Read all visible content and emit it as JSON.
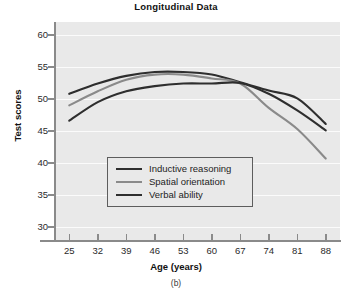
{
  "chart_data": {
    "type": "line",
    "title": "Longitudinal Data",
    "caption": "(b)",
    "xlabel": "Age (years)",
    "ylabel": "Test scores",
    "grid": true,
    "legend_position": "inside-lower-center",
    "x": [
      25,
      32,
      39,
      46,
      53,
      60,
      67,
      74,
      81,
      88
    ],
    "xtick_labels": [
      "25",
      "32",
      "39",
      "46",
      "53",
      "60",
      "67",
      "74",
      "81",
      "88"
    ],
    "ytick_labels": [
      "30",
      "35",
      "40",
      "45",
      "50",
      "55",
      "60"
    ],
    "yticks": [
      30,
      35,
      40,
      45,
      50,
      55,
      60
    ],
    "ylim": [
      28,
      62
    ],
    "xlim": [
      21.5,
      91.5
    ],
    "series": [
      {
        "name": "Inductive reasoning",
        "color": "#2e2e2e",
        "width": 2.1,
        "values": [
          50.8,
          52.4,
          53.6,
          54.2,
          54.2,
          53.8,
          52.6,
          51.3,
          50.1,
          46.1
        ]
      },
      {
        "name": "Spatial orientation",
        "color": "#8a8a8a",
        "width": 2.1,
        "values": [
          49.0,
          51.2,
          53.0,
          53.8,
          53.8,
          53.2,
          52.4,
          48.6,
          45.3,
          40.7
        ]
      },
      {
        "name": "Verbal ability",
        "color": "#2e2e2e",
        "width": 2.1,
        "values": [
          46.6,
          49.5,
          51.2,
          52.0,
          52.4,
          52.4,
          52.5,
          50.8,
          48.2,
          45.1
        ]
      }
    ]
  },
  "legend": {
    "entries": [
      {
        "label": "Inductive reasoning"
      },
      {
        "label": "Spatial orientation"
      },
      {
        "label": "Verbal ability"
      }
    ]
  }
}
